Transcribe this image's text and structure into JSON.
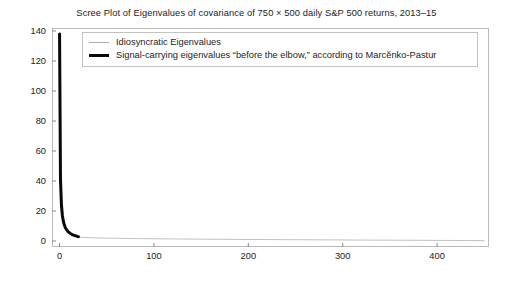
{
  "chart_data": {
    "type": "line",
    "title": "Scree Plot of Eigenvalues of covariance of 750 × 500 daily S&P 500 returns, 2013–15",
    "xlabel": "",
    "ylabel": "",
    "xlim": [
      -8,
      455
    ],
    "ylim": [
      -4,
      142
    ],
    "grid": false,
    "legend_position": "top-center",
    "xticks": [
      "0",
      "100",
      "200",
      "300",
      "400"
    ],
    "xtick_values": [
      0,
      100,
      200,
      300,
      400
    ],
    "yticks": [
      "0",
      "20",
      "40",
      "60",
      "80",
      "100",
      "120",
      "140"
    ],
    "ytick_values": [
      0,
      20,
      40,
      60,
      80,
      100,
      120,
      140
    ],
    "series": [
      {
        "name": "Idiosyncratic Eigenvalues",
        "color": "#b0b0b0",
        "linewidth": 0.8,
        "x": [
          20,
          24,
          28,
          33,
          38,
          44,
          50,
          58,
          66,
          75,
          85,
          96,
          108,
          121,
          135,
          150,
          166,
          183,
          201,
          220,
          240,
          261,
          283,
          306,
          330,
          355,
          381,
          408,
          430,
          450
        ],
        "y": [
          2.6,
          2.45,
          2.32,
          2.2,
          2.1,
          2.0,
          1.92,
          1.83,
          1.75,
          1.67,
          1.59,
          1.51,
          1.44,
          1.37,
          1.3,
          1.23,
          1.16,
          1.09,
          1.02,
          0.95,
          0.88,
          0.81,
          0.74,
          0.67,
          0.6,
          0.53,
          0.46,
          0.38,
          0.31,
          0.24
        ]
      },
      {
        "name": "Signal-carrying eigenvalues “before the elbow,” according to Marcĕnko-Pastur",
        "color": "#080808",
        "linewidth": 3.0,
        "x": [
          0,
          1,
          2,
          3,
          4,
          5,
          6,
          7,
          8,
          9,
          10,
          11,
          12,
          13,
          14,
          15,
          16,
          17,
          18,
          19,
          20
        ],
        "y": [
          138,
          41,
          24,
          17,
          13.2,
          10.8,
          9.1,
          7.9,
          7.0,
          6.3,
          5.7,
          5.2,
          4.8,
          4.45,
          4.15,
          3.9,
          3.65,
          3.45,
          3.25,
          3.05,
          2.9
        ]
      }
    ]
  },
  "legend": {
    "items": [
      {
        "label": "Idiosyncratic Eigenvalues",
        "swatch": "thin-gray-line"
      },
      {
        "label": "Signal-carrying eigenvalues “before the elbow,” according to Marcĕnko-Pastur",
        "swatch": "thick-black-line"
      }
    ]
  }
}
